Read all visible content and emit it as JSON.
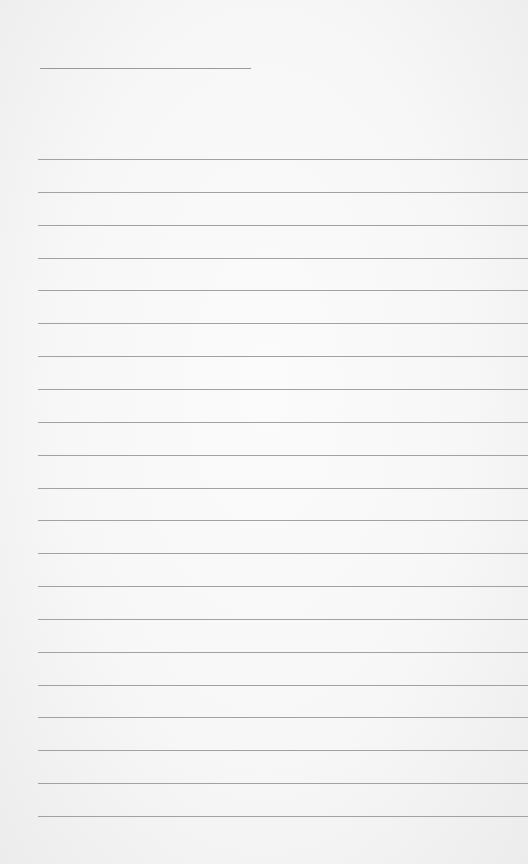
{
  "page": {
    "type": "lined-notepad",
    "title_line": {
      "text": ""
    },
    "rules": {
      "count": 21,
      "first_y": 159,
      "spacing": 32.85
    },
    "lines": [
      "",
      "",
      "",
      "",
      "",
      "",
      "",
      "",
      "",
      "",
      "",
      "",
      "",
      "",
      "",
      "",
      "",
      "",
      "",
      "",
      ""
    ],
    "colors": {
      "paper": "#f8f8f8",
      "rule": "#a2a2a2"
    }
  }
}
